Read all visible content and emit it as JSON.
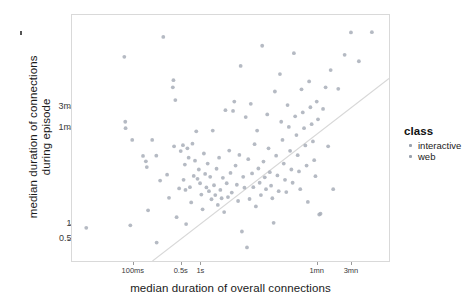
{
  "chart_data": {
    "type": "scatter",
    "title": "",
    "xlabel": "median duration of overall connections",
    "ylabel": "median duration of connections\nduring episode",
    "ylabel_line1": "median duration of connections",
    "ylabel_line2": "during episode",
    "grid": false,
    "xscale": "log",
    "yscale": "log",
    "xticks": [
      {
        "label": "100ms",
        "pos": 0.192
      },
      {
        "label": "0.5s",
        "pos": 0.343
      },
      {
        "label": "1s",
        "pos": 0.405
      },
      {
        "label": "1mn",
        "pos": 0.772
      },
      {
        "label": "3mn",
        "pos": 0.88
      }
    ],
    "yticks": [
      {
        "label": "3mn",
        "pos": 0.625
      },
      {
        "label": "1mn",
        "pos": 0.54
      },
      {
        "label": "1s",
        "pos": 0.15
      },
      {
        "label": "0.5s",
        "pos": 0.09
      }
    ],
    "reference_line": {
      "label": "y = x identity line",
      "x0": 0.254,
      "y0": 0.0,
      "x1": 1.0,
      "y1": 0.742,
      "color": "#d8d8d8"
    },
    "legend": {
      "title": "class",
      "position": "right",
      "entries": [
        {
          "label": "interactive",
          "color": "#9aa2ae"
        },
        {
          "label": "web",
          "color": "#9aa2ae"
        }
      ]
    },
    "marker": {
      "shape": "circle",
      "size": 1.9,
      "color": "#a8aeb8",
      "opacity": 0.85
    },
    "points": [
      {
        "x": 0.045,
        "y": 0.135,
        "class": "interactive"
      },
      {
        "x": 0.165,
        "y": 0.83,
        "class": "web"
      },
      {
        "x": 0.168,
        "y": 0.566,
        "class": "web"
      },
      {
        "x": 0.169,
        "y": 0.54,
        "class": "interactive"
      },
      {
        "x": 0.184,
        "y": 0.145,
        "class": "web"
      },
      {
        "x": 0.19,
        "y": 0.492,
        "class": "web"
      },
      {
        "x": 0.224,
        "y": 0.427,
        "class": "web"
      },
      {
        "x": 0.233,
        "y": 0.405,
        "class": "web"
      },
      {
        "x": 0.236,
        "y": 0.382,
        "class": "interactive"
      },
      {
        "x": 0.24,
        "y": 0.206,
        "class": "web"
      },
      {
        "x": 0.253,
        "y": 0.492,
        "class": "web"
      },
      {
        "x": 0.266,
        "y": 0.428,
        "class": "web"
      },
      {
        "x": 0.267,
        "y": 0.075,
        "class": "web"
      },
      {
        "x": 0.278,
        "y": 0.327,
        "class": "interactive"
      },
      {
        "x": 0.288,
        "y": 0.911,
        "class": "web"
      },
      {
        "x": 0.3,
        "y": 0.351,
        "class": "web"
      },
      {
        "x": 0.306,
        "y": 0.257,
        "class": "web"
      },
      {
        "x": 0.318,
        "y": 0.706,
        "class": "web"
      },
      {
        "x": 0.32,
        "y": 0.735,
        "class": "interactive"
      },
      {
        "x": 0.322,
        "y": 0.466,
        "class": "web"
      },
      {
        "x": 0.326,
        "y": 0.654,
        "class": "web"
      },
      {
        "x": 0.33,
        "y": 0.178,
        "class": "web"
      },
      {
        "x": 0.338,
        "y": 0.295,
        "class": "web"
      },
      {
        "x": 0.343,
        "y": 0.447,
        "class": "web"
      },
      {
        "x": 0.35,
        "y": 0.471,
        "class": "web"
      },
      {
        "x": 0.352,
        "y": 0.33,
        "class": "interactive"
      },
      {
        "x": 0.356,
        "y": 0.392,
        "class": "web"
      },
      {
        "x": 0.358,
        "y": 0.289,
        "class": "web"
      },
      {
        "x": 0.36,
        "y": 0.15,
        "class": "web"
      },
      {
        "x": 0.364,
        "y": 0.458,
        "class": "web"
      },
      {
        "x": 0.368,
        "y": 0.42,
        "class": "web"
      },
      {
        "x": 0.372,
        "y": 0.3,
        "class": "web"
      },
      {
        "x": 0.376,
        "y": 0.238,
        "class": "web"
      },
      {
        "x": 0.38,
        "y": 0.477,
        "class": "web"
      },
      {
        "x": 0.384,
        "y": 0.346,
        "class": "web"
      },
      {
        "x": 0.388,
        "y": 0.408,
        "class": "interactive"
      },
      {
        "x": 0.392,
        "y": 0.527,
        "class": "web"
      },
      {
        "x": 0.396,
        "y": 0.334,
        "class": "web"
      },
      {
        "x": 0.4,
        "y": 0.372,
        "class": "web"
      },
      {
        "x": 0.404,
        "y": 0.316,
        "class": "web"
      },
      {
        "x": 0.408,
        "y": 0.27,
        "class": "web"
      },
      {
        "x": 0.412,
        "y": 0.21,
        "class": "web"
      },
      {
        "x": 0.416,
        "y": 0.437,
        "class": "web"
      },
      {
        "x": 0.42,
        "y": 0.354,
        "class": "web"
      },
      {
        "x": 0.424,
        "y": 0.299,
        "class": "web"
      },
      {
        "x": 0.428,
        "y": 0.396,
        "class": "web"
      },
      {
        "x": 0.432,
        "y": 0.284,
        "class": "web"
      },
      {
        "x": 0.436,
        "y": 0.342,
        "class": "web"
      },
      {
        "x": 0.44,
        "y": 0.251,
        "class": "web"
      },
      {
        "x": 0.444,
        "y": 0.53,
        "class": "web"
      },
      {
        "x": 0.448,
        "y": 0.308,
        "class": "web"
      },
      {
        "x": 0.452,
        "y": 0.268,
        "class": "web"
      },
      {
        "x": 0.456,
        "y": 0.375,
        "class": "web"
      },
      {
        "x": 0.46,
        "y": 0.228,
        "class": "interactive"
      },
      {
        "x": 0.464,
        "y": 0.42,
        "class": "web"
      },
      {
        "x": 0.468,
        "y": 0.289,
        "class": "web"
      },
      {
        "x": 0.472,
        "y": 0.255,
        "class": "web"
      },
      {
        "x": 0.476,
        "y": 0.338,
        "class": "web"
      },
      {
        "x": 0.48,
        "y": 0.199,
        "class": "web"
      },
      {
        "x": 0.484,
        "y": 0.613,
        "class": "web"
      },
      {
        "x": 0.488,
        "y": 0.316,
        "class": "web"
      },
      {
        "x": 0.492,
        "y": 0.26,
        "class": "web"
      },
      {
        "x": 0.496,
        "y": 0.449,
        "class": "web"
      },
      {
        "x": 0.5,
        "y": 0.358,
        "class": "web"
      },
      {
        "x": 0.504,
        "y": 0.278,
        "class": "web"
      },
      {
        "x": 0.508,
        "y": 0.61,
        "class": "web"
      },
      {
        "x": 0.512,
        "y": 0.648,
        "class": "interactive"
      },
      {
        "x": 0.516,
        "y": 0.388,
        "class": "web"
      },
      {
        "x": 0.52,
        "y": 0.31,
        "class": "web"
      },
      {
        "x": 0.524,
        "y": 0.244,
        "class": "web"
      },
      {
        "x": 0.528,
        "y": 0.431,
        "class": "web"
      },
      {
        "x": 0.532,
        "y": 0.793,
        "class": "web"
      },
      {
        "x": 0.536,
        "y": 0.12,
        "class": "web"
      },
      {
        "x": 0.54,
        "y": 0.342,
        "class": "web"
      },
      {
        "x": 0.544,
        "y": 0.298,
        "class": "web"
      },
      {
        "x": 0.548,
        "y": 0.585,
        "class": "web"
      },
      {
        "x": 0.552,
        "y": 0.055,
        "class": "web"
      },
      {
        "x": 0.556,
        "y": 0.414,
        "class": "web"
      },
      {
        "x": 0.56,
        "y": 0.252,
        "class": "web"
      },
      {
        "x": 0.564,
        "y": 0.639,
        "class": "web"
      },
      {
        "x": 0.568,
        "y": 0.356,
        "class": "web"
      },
      {
        "x": 0.572,
        "y": 0.3,
        "class": "web"
      },
      {
        "x": 0.576,
        "y": 0.475,
        "class": "interactive"
      },
      {
        "x": 0.58,
        "y": 0.222,
        "class": "web"
      },
      {
        "x": 0.584,
        "y": 0.53,
        "class": "web"
      },
      {
        "x": 0.588,
        "y": 0.376,
        "class": "web"
      },
      {
        "x": 0.592,
        "y": 0.318,
        "class": "web"
      },
      {
        "x": 0.596,
        "y": 0.268,
        "class": "web"
      },
      {
        "x": 0.6,
        "y": 0.875,
        "class": "web"
      },
      {
        "x": 0.604,
        "y": 0.404,
        "class": "web"
      },
      {
        "x": 0.608,
        "y": 0.34,
        "class": "web"
      },
      {
        "x": 0.612,
        "y": 0.292,
        "class": "web"
      },
      {
        "x": 0.616,
        "y": 0.596,
        "class": "web"
      },
      {
        "x": 0.62,
        "y": 0.458,
        "class": "web"
      },
      {
        "x": 0.624,
        "y": 0.361,
        "class": "web"
      },
      {
        "x": 0.628,
        "y": 0.306,
        "class": "web"
      },
      {
        "x": 0.632,
        "y": 0.255,
        "class": "web"
      },
      {
        "x": 0.636,
        "y": 0.155,
        "class": "web"
      },
      {
        "x": 0.64,
        "y": 0.689,
        "class": "web"
      },
      {
        "x": 0.644,
        "y": 0.428,
        "class": "web"
      },
      {
        "x": 0.648,
        "y": 0.348,
        "class": "web"
      },
      {
        "x": 0.652,
        "y": 0.284,
        "class": "web"
      },
      {
        "x": 0.656,
        "y": 0.76,
        "class": "interactive"
      },
      {
        "x": 0.66,
        "y": 0.566,
        "class": "web"
      },
      {
        "x": 0.664,
        "y": 0.492,
        "class": "web"
      },
      {
        "x": 0.668,
        "y": 0.396,
        "class": "web"
      },
      {
        "x": 0.672,
        "y": 0.33,
        "class": "web"
      },
      {
        "x": 0.676,
        "y": 0.28,
        "class": "web"
      },
      {
        "x": 0.68,
        "y": 0.634,
        "class": "web"
      },
      {
        "x": 0.684,
        "y": 0.545,
        "class": "web"
      },
      {
        "x": 0.688,
        "y": 0.448,
        "class": "web"
      },
      {
        "x": 0.692,
        "y": 0.372,
        "class": "web"
      },
      {
        "x": 0.696,
        "y": 0.318,
        "class": "web"
      },
      {
        "x": 0.7,
        "y": 0.845,
        "class": "web"
      },
      {
        "x": 0.704,
        "y": 0.588,
        "class": "web"
      },
      {
        "x": 0.708,
        "y": 0.512,
        "class": "web"
      },
      {
        "x": 0.712,
        "y": 0.43,
        "class": "web"
      },
      {
        "x": 0.716,
        "y": 0.364,
        "class": "web"
      },
      {
        "x": 0.72,
        "y": 0.292,
        "class": "web"
      },
      {
        "x": 0.724,
        "y": 0.698,
        "class": "web"
      },
      {
        "x": 0.728,
        "y": 0.604,
        "class": "web"
      },
      {
        "x": 0.732,
        "y": 0.54,
        "class": "interactive"
      },
      {
        "x": 0.736,
        "y": 0.47,
        "class": "web"
      },
      {
        "x": 0.74,
        "y": 0.388,
        "class": "web"
      },
      {
        "x": 0.744,
        "y": 0.24,
        "class": "web"
      },
      {
        "x": 0.748,
        "y": 0.73,
        "class": "web"
      },
      {
        "x": 0.752,
        "y": 0.625,
        "class": "web"
      },
      {
        "x": 0.756,
        "y": 0.556,
        "class": "web"
      },
      {
        "x": 0.76,
        "y": 0.486,
        "class": "web"
      },
      {
        "x": 0.764,
        "y": 0.41,
        "class": "web"
      },
      {
        "x": 0.768,
        "y": 0.345,
        "class": "web"
      },
      {
        "x": 0.772,
        "y": 0.648,
        "class": "web"
      },
      {
        "x": 0.776,
        "y": 0.576,
        "class": "web"
      },
      {
        "x": 0.78,
        "y": 0.189,
        "class": "web"
      },
      {
        "x": 0.784,
        "y": 0.192,
        "class": "interactive"
      },
      {
        "x": 0.792,
        "y": 0.618,
        "class": "web"
      },
      {
        "x": 0.8,
        "y": 0.706,
        "class": "web"
      },
      {
        "x": 0.808,
        "y": 0.466,
        "class": "web"
      },
      {
        "x": 0.816,
        "y": 0.776,
        "class": "web"
      },
      {
        "x": 0.824,
        "y": 0.292,
        "class": "web"
      },
      {
        "x": 0.84,
        "y": 0.7,
        "class": "web"
      },
      {
        "x": 0.86,
        "y": 0.838,
        "class": "web"
      },
      {
        "x": 0.88,
        "y": 0.929,
        "class": "web"
      },
      {
        "x": 0.905,
        "y": 0.812,
        "class": "web"
      },
      {
        "x": 0.946,
        "y": 0.93,
        "class": "web"
      }
    ]
  },
  "corner_mark": {
    "name": "stray-artifact"
  }
}
